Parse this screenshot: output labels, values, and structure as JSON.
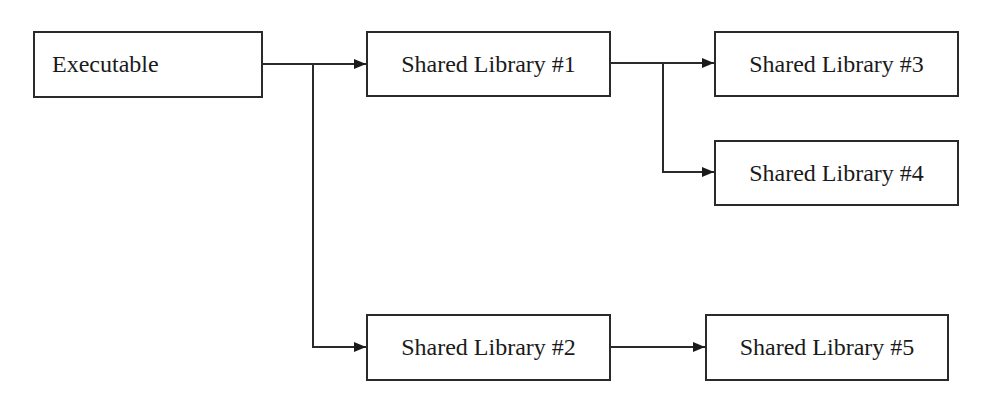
{
  "diagram": {
    "type": "dependency-tree",
    "nodes": [
      {
        "id": "exe",
        "label": "Executable"
      },
      {
        "id": "sl1",
        "label": "Shared Library #1"
      },
      {
        "id": "sl2",
        "label": "Shared Library #2"
      },
      {
        "id": "sl3",
        "label": "Shared Library #3"
      },
      {
        "id": "sl4",
        "label": "Shared Library #4"
      },
      {
        "id": "sl5",
        "label": "Shared Library #5"
      }
    ],
    "edges": [
      {
        "from": "Executable",
        "to": "Shared Library #1"
      },
      {
        "from": "Executable",
        "to": "Shared Library #2"
      },
      {
        "from": "Shared Library #1",
        "to": "Shared Library #3"
      },
      {
        "from": "Shared Library #1",
        "to": "Shared Library #4"
      },
      {
        "from": "Shared Library #2",
        "to": "Shared Library #5"
      }
    ],
    "colors": {
      "stroke": "#2a2a2a",
      "background": "#ffffff",
      "text": "#1a1a1a"
    }
  }
}
